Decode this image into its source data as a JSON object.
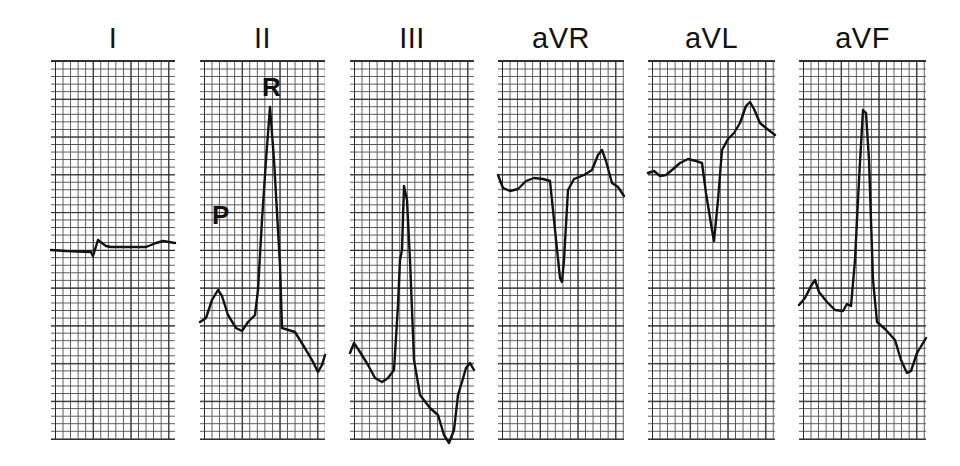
{
  "figure": {
    "grid_color": "#2a2a2a",
    "trace_color": "#111111",
    "background": "#ffffff"
  },
  "leads": [
    {
      "label": "I",
      "x": 51,
      "width": 124,
      "trace": "M0 190 L15 191 L40 192 L42 196 L47 180 L55 186 L60 187 L75 187 L95 187 L105 183 L112 181 L124 183"
    },
    {
      "label": "II",
      "x": 200,
      "width": 125,
      "trace": "M0 262 L6 258 L12 240 L18 230 L22 236 L28 255 L36 268 L42 271 L48 262 L55 255 L58 230 L62 160 L66 100 L70 47 L74 100 L78 170 L80 205 L82 268 L95 272 L103 285 L112 300 L118 312 L122 305 L125 295"
    },
    {
      "label": "III",
      "x": 350,
      "width": 124,
      "trace": "M0 293 L4 283 L10 292 L18 305 L25 318 L32 322 L38 318 L44 310 L48 245 L50 200 L52 190 L54 126 L57 140 L60 200 L64 300 L70 335 L80 348 L88 355 L94 375 L99 383 L104 370 L108 335 L112 322 L116 308 L120 303 L124 310"
    },
    {
      "label": "aVR",
      "x": 498,
      "width": 126,
      "trace": "M0 115 L5 128 L12 131 L20 129 L28 121 L36 118 L45 119 L52 121 L56 160 L62 218 L64 222 L66 200 L70 130 L76 119 L86 115 L94 110 L100 95 L104 90 L108 101 L114 123 L120 127 L126 136"
    },
    {
      "label": "aVL",
      "x": 648,
      "width": 127,
      "trace": "M0 113 L6 111 L12 116 L18 115 L24 110 L32 103 L40 99 L48 101 L54 103 L58 133 L64 170 L66 181 L70 140 L74 90 L80 79 L86 73 L92 63 L98 46 L102 42 L106 49 L112 63 L118 68 L127 75"
    },
    {
      "label": "aVF",
      "x": 799,
      "width": 127,
      "trace": "M0 245 L6 238 L12 226 L16 220 L20 232 L28 242 L36 250 L44 251 L48 244 L52 246 L56 200 L60 120 L64 50 L67 53 L70 100 L74 220 L78 262 L86 269 L96 280 L102 300 L108 313 L112 311 L118 293 L127 278"
    }
  ],
  "annotations": {
    "II_p_label": "P",
    "II_r_label": "R"
  }
}
